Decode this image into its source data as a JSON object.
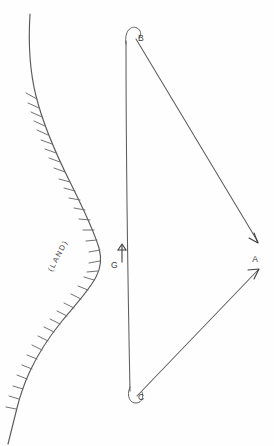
{
  "figure": {
    "kind": "hand-drawn-navigation-diagram",
    "background_color": "#fefefe",
    "line_color": "#5d5d5d",
    "width": 274,
    "height": 446
  },
  "labels": {
    "land": "(LAND)",
    "point_b": "B",
    "point_c": "C",
    "point_a": "A",
    "point_g": "G"
  },
  "points": [
    {
      "id": "B",
      "label": "B",
      "x": 133,
      "y": 36,
      "marker": "hook"
    },
    {
      "id": "C",
      "label": "C",
      "x": 134,
      "y": 396,
      "marker": "hook"
    },
    {
      "id": "A",
      "label": "A",
      "x": 260,
      "y": 258,
      "marker": "none"
    },
    {
      "id": "G",
      "label": "G",
      "x": 116,
      "y": 264,
      "marker": "up-arrow"
    }
  ],
  "lines": [
    {
      "id": "BC",
      "from": "B",
      "to": "C",
      "kind": "baseline",
      "arrow": "none"
    },
    {
      "id": "BA",
      "from": "B",
      "to": "A",
      "kind": "bearing",
      "arrow": "end"
    },
    {
      "id": "CA",
      "from": "C",
      "to": "A",
      "kind": "bearing",
      "arrow": "end"
    }
  ],
  "coastline": {
    "name": "land-boundary",
    "hatch_side": "land",
    "hatch_count": 26,
    "label": "(LAND)",
    "label_rotation_deg": -62
  },
  "icons": {
    "north_arrow": "up-arrow-icon",
    "hatch": "hatch-tick-icon"
  }
}
